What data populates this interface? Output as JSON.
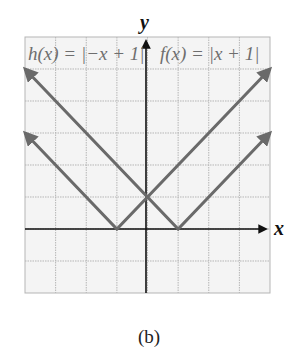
{
  "chart_data": {
    "type": "line",
    "title": "",
    "caption": "(b)",
    "xlabel": "x",
    "ylabel": "y",
    "xlim": [
      -4,
      4
    ],
    "ylim": [
      -2,
      6
    ],
    "grid": true,
    "grid_step": 1,
    "series": [
      {
        "name": "f(x) = |x + 1|",
        "label": "f(x) = |x + 1|",
        "x": [
          -4,
          -1,
          4
        ],
        "y": [
          3,
          0,
          5
        ]
      },
      {
        "name": "h(x) = |-x + 1|",
        "label": "h(x) = |−x + 1|",
        "x": [
          -4,
          1,
          4
        ],
        "y": [
          5,
          0,
          3
        ]
      }
    ],
    "annotations": [
      {
        "text": "h(x) = |−x + 1|",
        "position": "top-left"
      },
      {
        "text": "f(x) = |x + 1|",
        "position": "top-right"
      }
    ],
    "colors": {
      "grid": "#b5b5b5",
      "lines": "#6a6a6a",
      "axes": "#111111",
      "background": "#f4f4f4"
    }
  },
  "labels": {
    "h_label": "h(x) = |−x + 1|",
    "f_label": "f(x) = |x + 1|",
    "x_axis": "x",
    "y_axis": "y",
    "caption": "(b)"
  }
}
